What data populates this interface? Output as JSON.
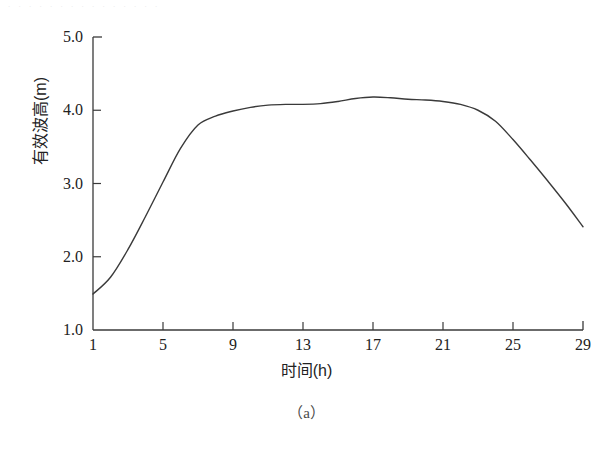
{
  "figure": {
    "caption": "（a）",
    "scan_remnant": ". . . . . . . . . . . . . . ."
  },
  "chart_data": {
    "type": "line",
    "title": "",
    "subtitle": "",
    "xlabel": "时间(h)",
    "ylabel": "有效波高(m)",
    "xlim": [
      1,
      29
    ],
    "ylim": [
      1.0,
      5.0
    ],
    "xticks": [
      1,
      5,
      9,
      13,
      17,
      21,
      25,
      29
    ],
    "xtick_labels": [
      "1",
      "5",
      "9",
      "13",
      "17",
      "21",
      "25",
      "29"
    ],
    "yticks": [
      1.0,
      2.0,
      3.0,
      4.0,
      5.0
    ],
    "ytick_labels": [
      "1.0",
      "2.0",
      "3.0",
      "4.0",
      "5.0"
    ],
    "grid": false,
    "legend": null,
    "legend_position": "none",
    "line_color": "#3a3a3a",
    "line_width": 1.4,
    "series": [
      {
        "name": "有效波高",
        "x": [
          1,
          2,
          3,
          4,
          5,
          6,
          7,
          8,
          9,
          10,
          11,
          12,
          13,
          14,
          15,
          16,
          17,
          18,
          19,
          20,
          21,
          22,
          23,
          24,
          25,
          26,
          27,
          28,
          29
        ],
        "values": [
          1.49,
          1.72,
          2.1,
          2.55,
          3.02,
          3.48,
          3.8,
          3.92,
          3.99,
          4.04,
          4.07,
          4.08,
          4.08,
          4.09,
          4.12,
          4.16,
          4.18,
          4.17,
          4.15,
          4.14,
          4.12,
          4.08,
          4.0,
          3.85,
          3.6,
          3.32,
          3.03,
          2.73,
          2.41
        ]
      }
    ],
    "annotations": []
  }
}
